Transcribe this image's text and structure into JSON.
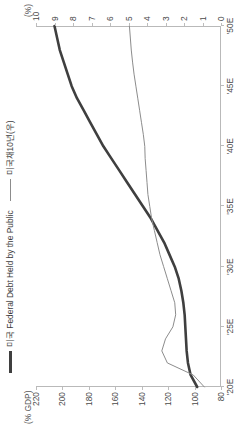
{
  "legend": {
    "items": [
      {
        "label": "미국 Federal Debt Held by the Public",
        "color": "#3f3f3f",
        "style": "thick"
      },
      {
        "label": "미국채10년(우)",
        "color": "#8c8c8c",
        "style": "thin"
      }
    ]
  },
  "axes": {
    "left_unit": "(% GDP)",
    "right_unit": "(%)"
  },
  "chart_data": {
    "type": "line",
    "title": "",
    "subtitle": "",
    "xlabel": "",
    "ylabel": "(% GDP)",
    "y2label": "(%)",
    "grid": false,
    "legend_position": "top",
    "x": [
      "'20E",
      "'21E",
      "'22E",
      "'23E",
      "'24E",
      "'25E",
      "'26E",
      "'27E",
      "'28E",
      "'29E",
      "'30E",
      "'31E",
      "'32E",
      "'33E",
      "'34E",
      "'35E",
      "'36E",
      "'37E",
      "'38E",
      "'39E",
      "'40E",
      "'41E",
      "'42E",
      "'43E",
      "'44E",
      "'45E",
      "'46E",
      "'47E",
      "'48E",
      "'49E",
      "'50E"
    ],
    "xtick_labels": [
      "'20E",
      "'25E",
      "'30E",
      "'35E",
      "'40E",
      "'45E",
      "'50E"
    ],
    "ytick_labels_left": [
      "220",
      "200",
      "180",
      "160",
      "140",
      "120",
      "100",
      "80"
    ],
    "ytick_labels_right": [
      "10",
      "9",
      "8",
      "7",
      "6",
      "5",
      "4",
      "3",
      "2",
      "1",
      "0"
    ],
    "ylim": [
      80,
      220
    ],
    "y2lim": [
      0,
      10
    ],
    "series": [
      {
        "name": "미국 Federal Debt Held by the Public",
        "axis": "left",
        "color": "#3f3f3f",
        "width": 2.6,
        "values": [
          98,
          103,
          105,
          106,
          106.5,
          107,
          107.5,
          108.5,
          110,
          112,
          115,
          119,
          123,
          128,
          133,
          139,
          145,
          151,
          157,
          163,
          169,
          174,
          179,
          184,
          189,
          193,
          196,
          199,
          202,
          204,
          206
        ]
      },
      {
        "name": "미국채10년(우)",
        "axis": "right",
        "color": "#8c8c8c",
        "width": 1.0,
        "values": [
          0.9,
          1.5,
          2.9,
          3.2,
          3.0,
          2.6,
          2.45,
          2.5,
          2.7,
          2.9,
          3.1,
          3.3,
          3.45,
          3.6,
          3.75,
          3.85,
          3.95,
          4.0,
          4.05,
          4.1,
          4.12,
          4.2,
          4.3,
          4.4,
          4.5,
          4.6,
          4.7,
          4.78,
          4.85,
          4.9,
          4.95
        ]
      }
    ]
  }
}
